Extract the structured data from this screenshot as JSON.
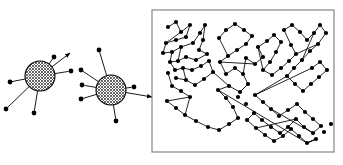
{
  "figure": {
    "background_color": "#ffffff",
    "node_color": "#000000",
    "edge_color": "#000000",
    "panel_border_color": "#7a7a7a",
    "hub_fill_pattern": "crosshatch",
    "hub_fill_color": "#b4b4b4",
    "width": 343,
    "height": 165
  },
  "hub_clusters": [
    {
      "name": "hub-cluster-left",
      "center": [
        40,
        76
      ],
      "radius": 15,
      "spokes": [
        {
          "to": [
            10,
            82
          ],
          "arrow": "in"
        },
        {
          "to": [
            6,
            109
          ],
          "arrow": "none"
        },
        {
          "to": [
            34,
            113
          ],
          "arrow": "none"
        },
        {
          "to": [
            54,
            57
          ],
          "arrow": "none"
        },
        {
          "to": [
            70,
            53
          ],
          "arrow": "out"
        },
        {
          "to": [
            71,
            71
          ],
          "arrow": "none"
        }
      ]
    },
    {
      "name": "hub-cluster-right",
      "center": [
        111,
        90
      ],
      "radius": 15,
      "spokes": [
        {
          "to": [
            99,
            50
          ],
          "arrow": "none"
        },
        {
          "to": [
            81,
            70
          ],
          "arrow": "none"
        },
        {
          "to": [
            82,
            85
          ],
          "arrow": "none"
        },
        {
          "to": [
            81,
            99
          ],
          "arrow": "in"
        },
        {
          "to": [
            116,
            121
          ],
          "arrow": "none"
        },
        {
          "to": [
            134,
            87
          ],
          "arrow": "none"
        },
        {
          "to": [
            152,
            97
          ],
          "arrow": "out"
        }
      ]
    }
  ],
  "panel": {
    "name": "network-panel",
    "x": 152,
    "y": 10,
    "width": 182,
    "height": 142
  },
  "chart_data": {
    "type": "graph",
    "node_count": 120,
    "nodes": [
      [
        168,
        27
      ],
      [
        176,
        22
      ],
      [
        181,
        32
      ],
      [
        190,
        25
      ],
      [
        186,
        37
      ],
      [
        176,
        40
      ],
      [
        166,
        43
      ],
      [
        163,
        53
      ],
      [
        172,
        52
      ],
      [
        181,
        47
      ],
      [
        193,
        43
      ],
      [
        200,
        33
      ],
      [
        205,
        25
      ],
      [
        203,
        40
      ],
      [
        199,
        50
      ],
      [
        207,
        54
      ],
      [
        196,
        60
      ],
      [
        186,
        57
      ],
      [
        178,
        61
      ],
      [
        170,
        62
      ],
      [
        175,
        70
      ],
      [
        183,
        68
      ],
      [
        192,
        70
      ],
      [
        201,
        66
      ],
      [
        209,
        61
      ],
      [
        176,
        78
      ],
      [
        186,
        80
      ],
      [
        195,
        85
      ],
      [
        204,
        79
      ],
      [
        213,
        72
      ],
      [
        168,
        73
      ],
      [
        172,
        86
      ],
      [
        181,
        91
      ],
      [
        190,
        97
      ],
      [
        167,
        101
      ],
      [
        176,
        108
      ],
      [
        185,
        115
      ],
      [
        196,
        121
      ],
      [
        208,
        127
      ],
      [
        219,
        130
      ],
      [
        229,
        124
      ],
      [
        238,
        118
      ],
      [
        233,
        107
      ],
      [
        226,
        98
      ],
      [
        218,
        90
      ],
      [
        229,
        86
      ],
      [
        240,
        92
      ],
      [
        248,
        84
      ],
      [
        243,
        74
      ],
      [
        235,
        68
      ],
      [
        226,
        74
      ],
      [
        220,
        62
      ],
      [
        228,
        56
      ],
      [
        237,
        50
      ],
      [
        246,
        44
      ],
      [
        252,
        36
      ],
      [
        244,
        30
      ],
      [
        235,
        24
      ],
      [
        226,
        30
      ],
      [
        219,
        38
      ],
      [
        246,
        58
      ],
      [
        255,
        64
      ],
      [
        263,
        57
      ],
      [
        258,
        47
      ],
      [
        267,
        41
      ],
      [
        274,
        35
      ],
      [
        281,
        42
      ],
      [
        276,
        52
      ],
      [
        270,
        62
      ],
      [
        263,
        70
      ],
      [
        272,
        75
      ],
      [
        281,
        68
      ],
      [
        289,
        61
      ],
      [
        296,
        54
      ],
      [
        291,
        45
      ],
      [
        284,
        30
      ],
      [
        292,
        25
      ],
      [
        300,
        32
      ],
      [
        307,
        40
      ],
      [
        314,
        33
      ],
      [
        320,
        25
      ],
      [
        326,
        33
      ],
      [
        318,
        44
      ],
      [
        310,
        51
      ],
      [
        302,
        60
      ],
      [
        294,
        68
      ],
      [
        287,
        76
      ],
      [
        295,
        84
      ],
      [
        303,
        91
      ],
      [
        311,
        84
      ],
      [
        319,
        77
      ],
      [
        327,
        70
      ],
      [
        320,
        62
      ],
      [
        312,
        68
      ],
      [
        255,
        95
      ],
      [
        263,
        102
      ],
      [
        271,
        109
      ],
      [
        279,
        116
      ],
      [
        288,
        110
      ],
      [
        297,
        104
      ],
      [
        305,
        112
      ],
      [
        313,
        119
      ],
      [
        321,
        126
      ],
      [
        313,
        133
      ],
      [
        304,
        127
      ],
      [
        296,
        119
      ],
      [
        288,
        127
      ],
      [
        280,
        133
      ],
      [
        271,
        127
      ],
      [
        262,
        120
      ],
      [
        254,
        113
      ],
      [
        247,
        120
      ],
      [
        256,
        128
      ],
      [
        265,
        135
      ],
      [
        274,
        141
      ],
      [
        283,
        136
      ],
      [
        291,
        129
      ],
      [
        299,
        136
      ],
      [
        307,
        143
      ],
      [
        316,
        139
      ],
      [
        324,
        132
      ],
      [
        331,
        124
      ],
      [
        246,
        104
      ],
      [
        238,
        97
      ]
    ],
    "edges": [
      [
        0,
        1
      ],
      [
        1,
        2
      ],
      [
        2,
        3
      ],
      [
        3,
        4
      ],
      [
        4,
        5
      ],
      [
        5,
        6
      ],
      [
        6,
        7
      ],
      [
        7,
        8
      ],
      [
        8,
        9
      ],
      [
        9,
        10
      ],
      [
        10,
        11
      ],
      [
        11,
        12
      ],
      [
        12,
        13
      ],
      [
        13,
        14
      ],
      [
        14,
        15
      ],
      [
        15,
        16
      ],
      [
        16,
        17
      ],
      [
        17,
        18
      ],
      [
        18,
        19
      ],
      [
        19,
        20
      ],
      [
        20,
        21
      ],
      [
        21,
        22
      ],
      [
        22,
        23
      ],
      [
        23,
        24
      ],
      [
        24,
        29
      ],
      [
        25,
        26
      ],
      [
        26,
        27
      ],
      [
        27,
        28
      ],
      [
        28,
        29
      ],
      [
        30,
        31
      ],
      [
        31,
        32
      ],
      [
        32,
        33
      ],
      [
        33,
        34
      ],
      [
        34,
        35
      ],
      [
        35,
        36
      ],
      [
        36,
        37
      ],
      [
        37,
        38
      ],
      [
        38,
        39
      ],
      [
        39,
        40
      ],
      [
        40,
        41
      ],
      [
        41,
        42
      ],
      [
        42,
        43
      ],
      [
        43,
        44
      ],
      [
        44,
        45
      ],
      [
        45,
        46
      ],
      [
        46,
        47
      ],
      [
        47,
        48
      ],
      [
        48,
        49
      ],
      [
        49,
        50
      ],
      [
        50,
        51
      ],
      [
        51,
        52
      ],
      [
        52,
        53
      ],
      [
        53,
        54
      ],
      [
        54,
        55
      ],
      [
        55,
        56
      ],
      [
        56,
        57
      ],
      [
        57,
        58
      ],
      [
        58,
        59
      ],
      [
        59,
        52
      ],
      [
        48,
        60
      ],
      [
        60,
        61
      ],
      [
        61,
        62
      ],
      [
        62,
        63
      ],
      [
        63,
        64
      ],
      [
        64,
        65
      ],
      [
        65,
        66
      ],
      [
        66,
        67
      ],
      [
        67,
        68
      ],
      [
        68,
        69
      ],
      [
        69,
        70
      ],
      [
        70,
        71
      ],
      [
        71,
        72
      ],
      [
        72,
        73
      ],
      [
        73,
        74
      ],
      [
        74,
        75
      ],
      [
        75,
        76
      ],
      [
        76,
        77
      ],
      [
        77,
        78
      ],
      [
        78,
        79
      ],
      [
        79,
        80
      ],
      [
        80,
        81
      ],
      [
        81,
        82
      ],
      [
        82,
        83
      ],
      [
        83,
        84
      ],
      [
        84,
        85
      ],
      [
        85,
        86
      ],
      [
        86,
        87
      ],
      [
        87,
        88
      ],
      [
        88,
        89
      ],
      [
        89,
        90
      ],
      [
        90,
        91
      ],
      [
        91,
        92
      ],
      [
        92,
        93
      ],
      [
        93,
        94
      ],
      [
        94,
        95
      ],
      [
        95,
        96
      ],
      [
        96,
        97
      ],
      [
        97,
        98
      ],
      [
        98,
        99
      ],
      [
        99,
        100
      ],
      [
        100,
        101
      ],
      [
        101,
        102
      ],
      [
        102,
        103
      ],
      [
        103,
        104
      ],
      [
        104,
        105
      ],
      [
        105,
        106
      ],
      [
        106,
        107
      ],
      [
        107,
        108
      ],
      [
        108,
        109
      ],
      [
        109,
        110
      ],
      [
        110,
        111
      ],
      [
        111,
        112
      ],
      [
        112,
        113
      ],
      [
        113,
        114
      ],
      [
        114,
        115
      ],
      [
        115,
        116
      ],
      [
        116,
        117
      ],
      [
        117,
        118
      ],
      [
        118,
        119
      ],
      [
        119,
        118
      ],
      [
        44,
        118
      ],
      [
        118,
        119
      ],
      [
        8,
        19
      ],
      [
        9,
        18
      ],
      [
        2,
        6
      ],
      [
        21,
        26
      ],
      [
        33,
        36
      ],
      [
        63,
        69
      ],
      [
        79,
        84
      ],
      [
        96,
        103
      ],
      [
        105,
        112
      ],
      [
        29,
        45
      ],
      [
        51,
        61
      ],
      [
        73,
        82
      ],
      [
        86,
        94
      ]
    ],
    "xlabel": "",
    "ylabel": "",
    "grid": false,
    "legend": false
  }
}
